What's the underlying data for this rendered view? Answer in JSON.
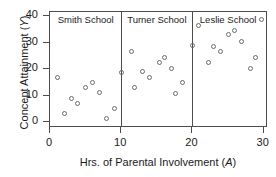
{
  "chart_data": {
    "type": "scatter",
    "title": "",
    "xlabel": "Hrs. of Parental Involvement (A)",
    "ylabel": "Concept Attainment (Y)",
    "xlabel_text": "Hrs. of Parental Involvement (",
    "xlabel_italic": "A",
    "xlabel_tail": ")",
    "ylabel_text": "Concept Attainment (",
    "ylabel_italic": "Y",
    "ylabel_tail": ")",
    "xlim": [
      0,
      30.6
    ],
    "ylim": [
      -2.2,
      41.5
    ],
    "xticks": [
      0,
      10,
      20,
      30
    ],
    "xtick_labels": [
      "0",
      "10",
      "20",
      "30"
    ],
    "yticks": [
      0,
      10,
      20,
      30,
      40
    ],
    "ytick_labels": [
      "0",
      "10",
      "20",
      "30",
      "40"
    ],
    "grid": false,
    "legend": "none",
    "panel_dividers": [
      10,
      20
    ],
    "marker": "open-circle",
    "marker_color": "#6b6b6b",
    "panels": [
      {
        "label": "Smith School",
        "label_x": 5.0,
        "range": [
          0,
          10
        ],
        "points": [
          {
            "x": 1.0,
            "y": 17.0
          },
          {
            "x": 2.0,
            "y": 3.2
          },
          {
            "x": 3.0,
            "y": 9.0
          },
          {
            "x": 3.8,
            "y": 7.0
          },
          {
            "x": 5.0,
            "y": 13.2
          },
          {
            "x": 5.9,
            "y": 15.1
          },
          {
            "x": 6.9,
            "y": 11.3
          },
          {
            "x": 7.9,
            "y": 1.2
          },
          {
            "x": 9.1,
            "y": 5.0
          }
        ]
      },
      {
        "label": "Turner School",
        "label_x": 15.0,
        "range": [
          10,
          20
        ],
        "points": [
          {
            "x": 10.0,
            "y": 18.7
          },
          {
            "x": 11.5,
            "y": 26.8
          },
          {
            "x": 11.9,
            "y": 13.0
          },
          {
            "x": 13.0,
            "y": 19.0
          },
          {
            "x": 14.0,
            "y": 16.8
          },
          {
            "x": 15.3,
            "y": 22.3
          },
          {
            "x": 16.1,
            "y": 24.5
          },
          {
            "x": 17.0,
            "y": 20.4
          },
          {
            "x": 17.6,
            "y": 10.8
          },
          {
            "x": 18.6,
            "y": 15.0
          }
        ]
      },
      {
        "label": "Leslie School",
        "label_x": 25.0,
        "range": [
          20,
          30.6
        ],
        "points": [
          {
            "x": 20.0,
            "y": 28.7
          },
          {
            "x": 20.9,
            "y": 36.6
          },
          {
            "x": 22.2,
            "y": 22.5
          },
          {
            "x": 22.9,
            "y": 28.4
          },
          {
            "x": 23.9,
            "y": 26.6
          },
          {
            "x": 25.1,
            "y": 33.1
          },
          {
            "x": 25.9,
            "y": 34.4
          },
          {
            "x": 26.9,
            "y": 30.5
          },
          {
            "x": 28.1,
            "y": 20.4
          },
          {
            "x": 28.9,
            "y": 24.2
          },
          {
            "x": 29.7,
            "y": 38.7
          }
        ]
      }
    ]
  }
}
